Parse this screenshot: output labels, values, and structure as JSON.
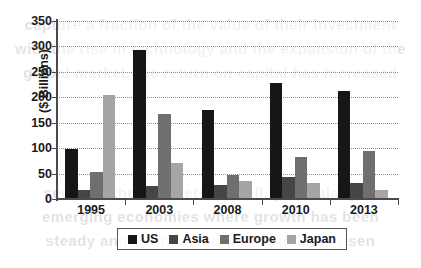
{
  "chart_data": {
    "type": "bar",
    "title": "",
    "subtitle": "",
    "xlabel": "",
    "ylabel": "($ Billions)",
    "ylim": [
      0,
      350
    ],
    "ytick_step": 50,
    "yticks": [
      350,
      300,
      250,
      200,
      150,
      100,
      50,
      0
    ],
    "ytick_labels": [
      "350",
      "300",
      "250",
      "200",
      "150",
      "100",
      "50",
      "0"
    ],
    "grid": true,
    "grid_axis": "y",
    "legend_position": "bottom",
    "categories": [
      "1995",
      "2003",
      "2008",
      "2010",
      "2013"
    ],
    "series": [
      {
        "name": "US",
        "color": "#161616",
        "values": [
          99,
          293,
          175,
          228,
          212
        ]
      },
      {
        "name": "Asia",
        "color": "#454545",
        "values": [
          18,
          25,
          27,
          43,
          32
        ]
      },
      {
        "name": "Europe",
        "color": "#6f6f6f",
        "values": [
          53,
          167,
          47,
          83,
          94
        ]
      },
      {
        "name": "Japan",
        "color": "#a5a5a5",
        "values": [
          205,
          71,
          36,
          32,
          17
        ]
      }
    ]
  },
  "legend": {
    "items": [
      {
        "label": "US"
      },
      {
        "label": "Asia"
      },
      {
        "label": "Europe"
      },
      {
        "label": "Japan"
      }
    ]
  },
  "scan_bleed": {
    "lines": [
      "capture a fraction of the value of their investment",
      "with the rise in technology and the expansion of the",
      "global market, the return on capital has increased",
      "",
      "",
      "",
      "",
      "seen in other markets as well, particularly in",
      "emerging economies where growth has been",
      "steady and the demand for capital has risen"
    ]
  }
}
